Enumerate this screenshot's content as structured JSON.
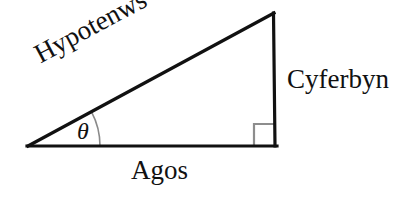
{
  "diagram": {
    "language": "cy",
    "background_color": "#ffffff",
    "stroke_color": "#111111",
    "marker_color": "#888888",
    "labels": {
      "hypotenuse": "Hypotenws",
      "opposite": "Cyferbyn",
      "adjacent": "Agos",
      "angle": "θ"
    },
    "icons": {
      "right_angle": "right-angle-marker",
      "angle_arc": "angle-arc"
    },
    "geometry": {
      "left_vertex": [
        28,
        146
      ],
      "right_vertex": [
        276,
        146
      ],
      "apex": [
        274,
        13
      ],
      "stroke_width": 3,
      "right_angle_square": [
        254,
        124,
        20,
        21
      ],
      "arc_radius": 72
    }
  }
}
